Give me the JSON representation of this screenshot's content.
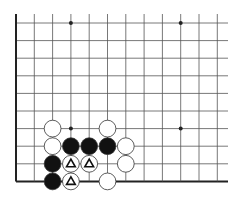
{
  "diagram": {
    "type": "go-board-fragment",
    "colors": {
      "background": "#ffffff",
      "line": "#555555",
      "edge": "#222222",
      "black_stone": "#111111",
      "white_stone": "#ffffff",
      "stone_outline": "#333333",
      "marker": "#111111"
    },
    "grid": {
      "origin_x": 16,
      "origin_y": 23,
      "spacing_x": 18.3,
      "spacing_y": 17.6,
      "columns": 12,
      "rows": 10,
      "extend_right_to": 228,
      "extend_top_to": 14,
      "edges": [
        "left",
        "bottom"
      ]
    },
    "star_points": [
      {
        "col": 3,
        "row": 0
      },
      {
        "col": 9,
        "row": 0
      },
      {
        "col": 3,
        "row": 6
      },
      {
        "col": 9,
        "row": 6
      }
    ],
    "stones": [
      {
        "color": "white",
        "col": 2,
        "row": 6,
        "marker": ""
      },
      {
        "color": "white",
        "col": 5,
        "row": 6,
        "marker": ""
      },
      {
        "color": "white",
        "col": 2,
        "row": 7,
        "marker": ""
      },
      {
        "color": "black",
        "col": 3,
        "row": 7,
        "marker": ""
      },
      {
        "color": "black",
        "col": 4,
        "row": 7,
        "marker": ""
      },
      {
        "color": "black",
        "col": 5,
        "row": 7,
        "marker": ""
      },
      {
        "color": "white",
        "col": 6,
        "row": 7,
        "marker": ""
      },
      {
        "color": "black",
        "col": 2,
        "row": 8,
        "marker": ""
      },
      {
        "color": "white",
        "col": 3,
        "row": 8,
        "marker": "triangle"
      },
      {
        "color": "white",
        "col": 4,
        "row": 8,
        "marker": "triangle"
      },
      {
        "color": "white",
        "col": 6,
        "row": 8,
        "marker": ""
      },
      {
        "color": "black",
        "col": 2,
        "row": 9,
        "marker": ""
      },
      {
        "color": "white",
        "col": 3,
        "row": 9,
        "marker": "triangle"
      },
      {
        "color": "white",
        "col": 5,
        "row": 9,
        "marker": ""
      }
    ]
  }
}
